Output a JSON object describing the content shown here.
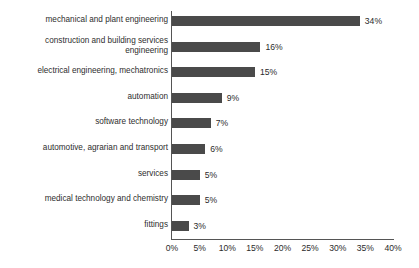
{
  "chart_data": {
    "type": "bar",
    "orientation": "horizontal",
    "title": "",
    "subtitle": "",
    "xlabel": "",
    "ylabel": "",
    "xlim": [
      0,
      40
    ],
    "grid": false,
    "legend": false,
    "value_suffix": "%",
    "categories": [
      "mechanical and plant engineering",
      "construction and building services\nengineering",
      "electrical engineering, mechatronics",
      "automation",
      "software technology",
      "automotive, agrarian and transport",
      "services",
      "medical technology and chemistry",
      "fittings"
    ],
    "values": [
      34,
      16,
      15,
      9,
      7,
      6,
      5,
      5,
      3
    ],
    "value_labels": [
      "34%",
      "16%",
      "15%",
      "9%",
      "7%",
      "6%",
      "5%",
      "5%",
      "3%"
    ],
    "xticks": [
      0,
      5,
      10,
      15,
      20,
      25,
      30,
      35,
      40
    ],
    "xtick_labels": [
      "0%",
      "5%",
      "10%",
      "15%",
      "20%",
      "25%",
      "30%",
      "35%",
      "40%"
    ],
    "colors": {
      "bar": "#4a4a4a",
      "axis": "#555555",
      "text": "#2b2b2b",
      "background": "#ffffff"
    }
  }
}
